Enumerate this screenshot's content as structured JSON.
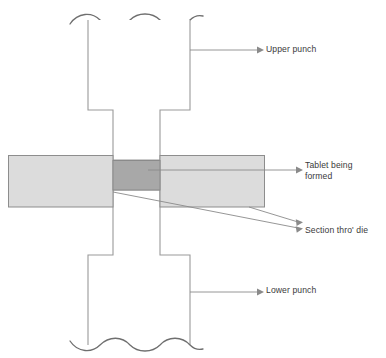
{
  "figure": {
    "kind": "cross-section-diagram"
  },
  "colors": {
    "outline": "#9a9a9a",
    "outline_dark": "#7d7d7d",
    "die_fill": "#dcdcdc",
    "die_stroke": "#8d8d8d",
    "tablet_fill": "#a8a8a8",
    "tablet_stroke": "#8a8a8a",
    "leader": "#8a8a8a",
    "text": "#3a3a3a",
    "background": "#ffffff"
  },
  "labels": {
    "upper_punch": "Upper punch",
    "tablet": "Tablet being\nformed",
    "section": "Section thro' die",
    "lower_punch": "Lower punch"
  },
  "parts": {
    "upper_punch": {
      "name": "Upper punch",
      "body_left": 88,
      "body_right": 190,
      "stem_left": 113,
      "stem_right": 160,
      "shoulder_y": 110,
      "break_y": 20
    },
    "lower_punch": {
      "name": "Lower punch",
      "body_left": 88,
      "body_right": 190,
      "stem_left": 113,
      "stem_right": 160,
      "shoulder_y": 255,
      "break_y": 345
    },
    "die_left": {
      "name": "Section thro' die (left block)",
      "x": 8,
      "y": 155,
      "width": 105,
      "height": 52
    },
    "die_right": {
      "name": "Section thro' die (right block)",
      "x": 160,
      "y": 155,
      "width": 105,
      "height": 52
    },
    "tablet": {
      "name": "Tablet being formed",
      "x": 113,
      "y": 160,
      "width": 47,
      "height": 30
    }
  },
  "leaders": [
    {
      "name": "upper-punch-leader",
      "from_x": 190,
      "from_y": 50,
      "to_x": 260,
      "to_y": 50
    },
    {
      "name": "tablet-leader",
      "from_x": 148,
      "from_y": 170,
      "to_x": 299,
      "to_y": 170
    },
    {
      "name": "section-die-leader-left",
      "from_x": 113,
      "from_y": 192,
      "to_x": 299,
      "to_y": 228
    },
    {
      "name": "section-die-leader-right",
      "from_x": 249,
      "from_y": 207,
      "to_x": 299,
      "to_y": 222
    },
    {
      "name": "lower-punch-leader",
      "from_x": 190,
      "from_y": 292,
      "to_x": 260,
      "to_y": 292
    }
  ]
}
